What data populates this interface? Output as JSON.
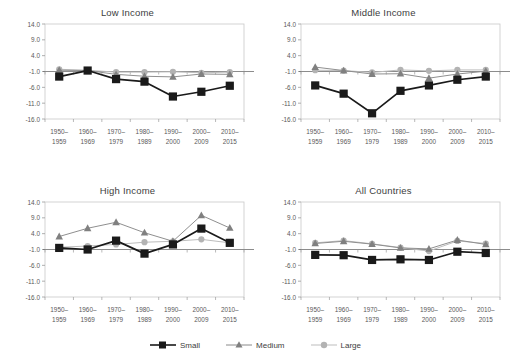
{
  "figure": {
    "legend": {
      "position": "bottom-center",
      "entries": [
        {
          "name": "Small",
          "color": "#1a1a1a",
          "marker": "square",
          "icon": "legend-marker-square-icon"
        },
        {
          "name": "Medium",
          "color": "#808080",
          "marker": "triangle",
          "icon": "legend-marker-triangle-icon"
        },
        {
          "name": "Large",
          "color": "#b3b3b3",
          "marker": "circle",
          "icon": "legend-marker-circle-icon"
        }
      ]
    }
  },
  "chart_data": [
    {
      "id": "low-income",
      "type": "line",
      "title": "Low Income",
      "xlabel": "",
      "ylabel": "",
      "ylim": [
        -16.0,
        14.0
      ],
      "yticks": [
        14.0,
        9.0,
        4.0,
        -1.0,
        -6.0,
        -11.0,
        -16.0
      ],
      "ytick_labels": [
        "14.0",
        "9.0",
        "4.0",
        "-1.0",
        "-6.0",
        "-11.0",
        "-16.0"
      ],
      "grid": false,
      "categories": [
        "1950–\n1959",
        "1960–\n1969",
        "1970–\n1979",
        "1980–\n1989",
        "1990–\n2000",
        "2000–\n2009",
        "2010–\n2015"
      ],
      "category_lines": [
        [
          "1950–",
          "1959"
        ],
        [
          "1960–",
          "1969"
        ],
        [
          "1970–",
          "1979"
        ],
        [
          "1980–",
          "1989"
        ],
        [
          "1990–",
          "2000"
        ],
        [
          "2000–",
          "2009"
        ],
        [
          "2010–",
          "2015"
        ]
      ],
      "series": [
        {
          "name": "Small",
          "values": [
            -2.6,
            -0.7,
            -3.4,
            -4.2,
            -8.9,
            -7.4,
            -5.5
          ]
        },
        {
          "name": "Medium",
          "values": [
            -0.6,
            -0.7,
            -1.9,
            -2.5,
            -2.7,
            -1.8,
            -1.9
          ]
        },
        {
          "name": "Large",
          "values": [
            -0.3,
            -0.6,
            -1.2,
            -1.2,
            -1.1,
            -1.4,
            -1.2
          ]
        }
      ]
    },
    {
      "id": "middle-income",
      "type": "line",
      "title": "Middle Income",
      "xlabel": "",
      "ylabel": "",
      "ylim": [
        -16.0,
        14.0
      ],
      "yticks": [
        14.0,
        9.0,
        4.0,
        -1.0,
        -6.0,
        -11.0,
        -16.0
      ],
      "ytick_labels": [
        "14.0",
        "9.0",
        "4.0",
        "-1.0",
        "-6.0",
        "-11.0",
        "-16.0"
      ],
      "grid": false,
      "categories": [
        "1950–\n1959",
        "1960–\n1969",
        "1970–\n1979",
        "1980–\n1989",
        "1990–\n2000",
        "2000–\n2009",
        "2010–\n2015"
      ],
      "category_lines": [
        [
          "1950–",
          "1959"
        ],
        [
          "1960–",
          "1969"
        ],
        [
          "1970–",
          "1979"
        ],
        [
          "1980–",
          "1989"
        ],
        [
          "1990–",
          "2000"
        ],
        [
          "2000–",
          "2009"
        ],
        [
          "2010–",
          "2015"
        ]
      ],
      "series": [
        {
          "name": "Small",
          "values": [
            -5.4,
            -8.0,
            -14.2,
            -7.1,
            -5.4,
            -3.6,
            -2.6
          ]
        },
        {
          "name": "Medium",
          "values": [
            0.4,
            -0.7,
            -1.8,
            -1.7,
            -3.1,
            -1.8,
            -0.9
          ]
        },
        {
          "name": "Large",
          "values": [
            -0.6,
            -0.7,
            -1.3,
            -0.5,
            -0.8,
            -0.5,
            -0.5
          ]
        }
      ]
    },
    {
      "id": "high-income",
      "type": "line",
      "title": "High Income",
      "xlabel": "",
      "ylabel": "",
      "ylim": [
        -16.0,
        14.0
      ],
      "yticks": [
        14.0,
        9.0,
        4.0,
        -1.0,
        -6.0,
        -11.0,
        -16.0
      ],
      "ytick_labels": [
        "14.0",
        "9.0",
        "4.0",
        "-1.0",
        "-6.0",
        "-11.0",
        "-16.0"
      ],
      "grid": false,
      "categories": [
        "1950–\n1959",
        "1960–\n1969",
        "1970–\n1979",
        "1980–\n1989",
        "1990–\n2000",
        "2000–\n2009",
        "2010–\n2015"
      ],
      "category_lines": [
        [
          "1950–",
          "1959"
        ],
        [
          "1960–",
          "1969"
        ],
        [
          "1970–",
          "1979"
        ],
        [
          "1980–",
          "1989"
        ],
        [
          "1990–",
          "2000"
        ],
        [
          "2000–",
          "2009"
        ],
        [
          "2010–",
          "2015"
        ]
      ],
      "series": [
        {
          "name": "Small",
          "values": [
            -0.5,
            -1.0,
            1.8,
            -2.3,
            0.6,
            5.6,
            1.1
          ]
        },
        {
          "name": "Medium",
          "values": [
            3.1,
            5.7,
            7.6,
            4.3,
            1.6,
            9.8,
            5.8
          ]
        },
        {
          "name": "Large",
          "values": [
            -0.3,
            0.1,
            0.6,
            1.3,
            1.6,
            2.2,
            1.1
          ]
        }
      ]
    },
    {
      "id": "all-countries",
      "type": "line",
      "title": "All Countries",
      "xlabel": "",
      "ylabel": "",
      "ylim": [
        -16.0,
        14.0
      ],
      "yticks": [
        14.0,
        9.0,
        4.0,
        -1.0,
        -6.0,
        -11.0,
        -16.0
      ],
      "ytick_labels": [
        "14.0",
        "9.0",
        "4.0",
        "-1.0",
        "-6.0",
        "-11.0",
        "-16.0"
      ],
      "grid": false,
      "categories": [
        "1950–\n1959",
        "1960–\n1969",
        "1970–\n1979",
        "1980–\n1989",
        "1990–\n2000",
        "2000–\n2009",
        "2010–\n2015"
      ],
      "category_lines": [
        [
          "1950–",
          "1959"
        ],
        [
          "1960–",
          "1969"
        ],
        [
          "1970–",
          "1979"
        ],
        [
          "1980–",
          "1989"
        ],
        [
          "1990–",
          "2000"
        ],
        [
          "2000–",
          "2009"
        ],
        [
          "2010–",
          "2015"
        ]
      ],
      "series": [
        {
          "name": "Small",
          "values": [
            -2.7,
            -2.8,
            -4.3,
            -4.1,
            -4.3,
            -1.7,
            -2.1
          ]
        },
        {
          "name": "Medium",
          "values": [
            0.9,
            1.6,
            0.7,
            -0.5,
            -0.8,
            2.0,
            0.6
          ]
        },
        {
          "name": "Large",
          "values": [
            1.1,
            1.8,
            0.8,
            -0.4,
            -1.5,
            1.7,
            0.9
          ]
        }
      ]
    }
  ]
}
